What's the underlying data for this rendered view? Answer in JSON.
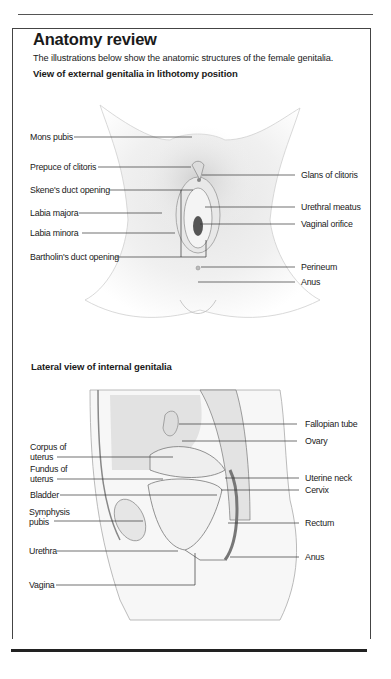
{
  "header": {
    "title": "Anatomy review",
    "intro": "The illustrations below show the anatomic structures of the female genitalia."
  },
  "external_view": {
    "heading": "View of external genitalia in lithotomy position",
    "labels_left": [
      "Mons pubis",
      "Prepuce of clitoris",
      "Skene's duct opening",
      "Labia majora",
      "Labia minora",
      "Bartholin's duct opening"
    ],
    "labels_right": [
      "Glans of clitoris",
      "Urethral meatus",
      "Vaginal orifice",
      "Perineum",
      "Anus"
    ]
  },
  "internal_view": {
    "heading": "Lateral view of internal genitalia",
    "labels_left": [
      {
        "line1": "Corpus of",
        "line2": "uterus"
      },
      {
        "line1": "Fundus of",
        "line2": "uterus"
      },
      {
        "line1": "Bladder",
        "line2": ""
      },
      {
        "line1": "Symphysis",
        "line2": "pubis"
      },
      {
        "line1": "Urethra",
        "line2": ""
      },
      {
        "line1": "Vagina",
        "line2": ""
      }
    ],
    "labels_right": [
      "Fallopian tube",
      "Ovary",
      "Uterine neck",
      "Cervix",
      "Rectum",
      "Anus"
    ]
  }
}
